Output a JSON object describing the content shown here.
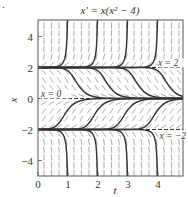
{
  "figure": {
    "marker": ".",
    "title": "x' = x(x² − 4)",
    "xlabel": "t",
    "ylabel": "x",
    "t_range": [
      0,
      4.83
    ],
    "x_range": [
      -5.0,
      5.06
    ],
    "t_ticks": [
      {
        "value": 0,
        "label": "0"
      },
      {
        "value": 1,
        "label": "1"
      },
      {
        "value": 2,
        "label": "2"
      },
      {
        "value": 3,
        "label": "3"
      },
      {
        "value": 4,
        "label": "4"
      }
    ],
    "x_ticks": [
      {
        "value": 4,
        "label": "4"
      },
      {
        "value": 2,
        "label": "2"
      },
      {
        "value": 0,
        "label": "0"
      },
      {
        "value": -2,
        "label": "−2"
      },
      {
        "value": -4,
        "label": "−4"
      }
    ],
    "equilibria": [
      {
        "value": 2,
        "label": "x = 2",
        "label_t": 4.0
      },
      {
        "value": 0,
        "label": "x = 0",
        "label_t": 0.1
      },
      {
        "value": -2,
        "label": "x = −2",
        "label_t": 4.05
      }
    ],
    "solution_shifts": [
      0,
      1,
      2,
      3
    ],
    "colors": {
      "axis": "#555555",
      "curve": "#333333",
      "field": "#888888",
      "equilibrium": "#333333",
      "text": "#333333"
    }
  },
  "chart_data": {
    "type": "line",
    "title": "x' = x(x² − 4)",
    "xlabel": "t",
    "ylabel": "x",
    "xlim": [
      0,
      4.83
    ],
    "ylim": [
      -5,
      5
    ],
    "grid": false,
    "x_ticks": [
      0,
      1,
      2,
      3,
      4
    ],
    "y_ticks": [
      -4,
      -2,
      0,
      2,
      4
    ],
    "annotations": [
      "x = 2",
      "x = 0",
      "x = −2"
    ],
    "slope_field": "x(x^2 - 4)",
    "series": [
      {
        "name": "equilibrium x=2",
        "style": "dashed",
        "x": [
          0,
          4.83
        ],
        "y": [
          2,
          2
        ]
      },
      {
        "name": "equilibrium x=0",
        "style": "dashed",
        "x": [
          0,
          4.83
        ],
        "y": [
          0,
          0
        ]
      },
      {
        "name": "equilibrium x=-2",
        "style": "dashed",
        "x": [
          0,
          4.83
        ],
        "y": [
          -2,
          -2
        ]
      },
      {
        "name": "upper solutions (blow up)",
        "vertical_asymptotes_t": [
          1,
          2,
          3,
          4
        ],
        "direction": "up from x=2"
      },
      {
        "name": "lower solutions (blow down)",
        "vertical_asymptotes_t": [
          1,
          2,
          3,
          4
        ],
        "direction": "down from x=-2"
      },
      {
        "name": "middle-upper solutions",
        "midpoints_t": [
          1.3,
          2.3,
          3.3,
          4.3
        ],
        "direction": "from x=2 to x=0"
      },
      {
        "name": "middle-lower solutions",
        "midpoints_t": [
          0.9,
          1.9,
          2.9,
          3.9
        ],
        "direction": "from x=-2 to x=0"
      }
    ]
  }
}
